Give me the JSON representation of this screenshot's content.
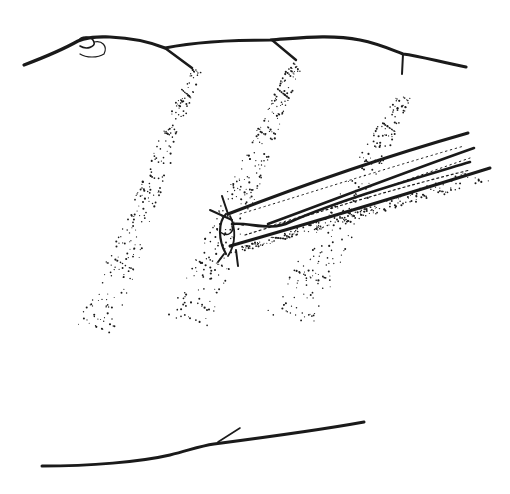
{
  "illustration": {
    "kind": "pen-and-ink anatomical sketch",
    "colors": {
      "ink": "#1a1a1a",
      "background": "#ffffff"
    },
    "elements": [
      "upper-contour-line",
      "nodule",
      "stippled-shading-left",
      "stippled-shading-middle",
      "stippled-shading-right",
      "tube-bundle",
      "tied-knot",
      "lower-contour-line"
    ]
  }
}
